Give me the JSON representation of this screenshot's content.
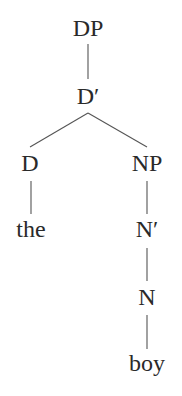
{
  "diagram": {
    "type": "syntax-tree",
    "nodes": [
      {
        "id": "dp",
        "label": "DP",
        "x": 88,
        "y": 36
      },
      {
        "id": "dbar",
        "label": "D′",
        "x": 88,
        "y": 104
      },
      {
        "id": "d",
        "label": "D",
        "x": 30,
        "y": 171
      },
      {
        "id": "np",
        "label": "NP",
        "x": 147,
        "y": 171
      },
      {
        "id": "the",
        "label": "the",
        "x": 31,
        "y": 237
      },
      {
        "id": "nbar",
        "label": "N′",
        "x": 147,
        "y": 237
      },
      {
        "id": "n",
        "label": "N",
        "x": 147,
        "y": 305
      },
      {
        "id": "boy",
        "label": "boy",
        "x": 147,
        "y": 371
      }
    ],
    "edges": [
      {
        "from": "dp",
        "to": "dbar"
      },
      {
        "from": "dbar",
        "to": "d"
      },
      {
        "from": "dbar",
        "to": "np"
      },
      {
        "from": "d",
        "to": "the"
      },
      {
        "from": "np",
        "to": "nbar"
      },
      {
        "from": "nbar",
        "to": "n"
      },
      {
        "from": "n",
        "to": "boy"
      }
    ]
  }
}
